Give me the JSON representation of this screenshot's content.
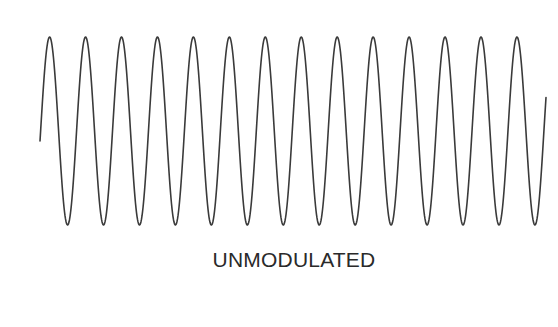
{
  "diagram": {
    "caption": "UNMODULATED",
    "stroke_color": "#3a3a3a",
    "text_color": "#2a2a2a",
    "background": "#ffffff"
  },
  "chart_data": {
    "type": "line",
    "title": "UNMODULATED",
    "waveform": "sine",
    "cycles_visible": 14,
    "peak_count": 14,
    "trough_count": 14,
    "geometry_px": {
      "x_start": 40,
      "x_end": 546,
      "first_peak_x": 49.6,
      "period": 35.95,
      "peak_y": 37,
      "trough_y": 225,
      "midline_y": 131,
      "amplitude": 94
    },
    "xlabel": "",
    "ylabel": "",
    "grid": false,
    "legend": false
  }
}
